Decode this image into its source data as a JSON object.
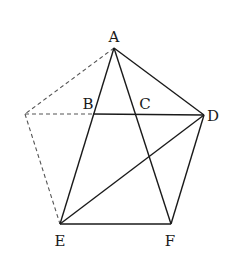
{
  "diagram": {
    "type": "geometry-figure",
    "points": {
      "A": {
        "x": 114,
        "y": 48,
        "label": "A",
        "lx": 114,
        "ly": 42,
        "anchor": "middle"
      },
      "B": {
        "x": 93,
        "y": 114,
        "label": "B",
        "lx": 88,
        "ly": 109,
        "anchor": "middle"
      },
      "C": {
        "x": 136,
        "y": 114,
        "label": "C",
        "lx": 145,
        "ly": 109,
        "anchor": "middle"
      },
      "D": {
        "x": 204,
        "y": 115,
        "label": "D",
        "lx": 207,
        "ly": 121,
        "anchor": "start"
      },
      "E": {
        "x": 60,
        "y": 224,
        "label": "E",
        "lx": 60,
        "ly": 246,
        "anchor": "middle"
      },
      "F": {
        "x": 171,
        "y": 224,
        "label": "F",
        "lx": 170,
        "ly": 246,
        "anchor": "middle"
      },
      "P": {
        "x": 25,
        "y": 114,
        "label": "",
        "lx": 0,
        "ly": 0,
        "anchor": "middle"
      }
    },
    "solid_segments": [
      [
        "A",
        "E"
      ],
      [
        "A",
        "F"
      ],
      [
        "A",
        "D"
      ],
      [
        "B",
        "D"
      ],
      [
        "E",
        "F"
      ],
      [
        "F",
        "D"
      ],
      [
        "E",
        "D"
      ]
    ],
    "dashed_segments": [
      [
        "A",
        "P"
      ],
      [
        "P",
        "B"
      ],
      [
        "P",
        "E"
      ]
    ],
    "labels": [
      "A",
      "B",
      "C",
      "D",
      "E",
      "F"
    ],
    "colors": {
      "line": "#1a1a1a",
      "dashed": "#555555",
      "background": "#ffffff"
    }
  }
}
